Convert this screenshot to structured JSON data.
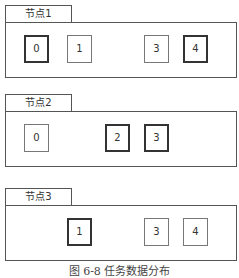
{
  "nodes": [
    {
      "label": "节点1",
      "blocks": [
        {
          "id": "0",
          "x": 19,
          "highlighted": true
        },
        {
          "id": "1",
          "x": 62,
          "highlighted": false
        },
        {
          "id": "3",
          "x": 139,
          "highlighted": false
        },
        {
          "id": "4",
          "x": 178,
          "highlighted": true
        }
      ]
    },
    {
      "label": "节点2",
      "blocks": [
        {
          "id": "0",
          "x": 19,
          "highlighted": false
        },
        {
          "id": "2",
          "x": 100,
          "highlighted": true
        },
        {
          "id": "3",
          "x": 139,
          "highlighted": true
        }
      ]
    },
    {
      "label": "节点3",
      "blocks": [
        {
          "id": "1",
          "x": 62,
          "highlighted": true
        },
        {
          "id": "3",
          "x": 139,
          "highlighted": false
        },
        {
          "id": "4",
          "x": 178,
          "highlighted": false
        }
      ]
    }
  ],
  "caption": "图 6-8   任务数据分布"
}
